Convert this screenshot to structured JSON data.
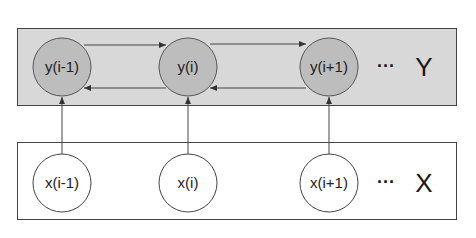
{
  "colors": {
    "background": "#ffffff",
    "y_layer_fill": "#d8d8d8",
    "y_node_fill": "#bdbdbd",
    "x_layer_fill": "#ffffff",
    "x_node_fill": "#ffffff",
    "stroke": "#444444"
  },
  "layers": {
    "y": {
      "label": "Y",
      "ellipsis": "···",
      "nodes": [
        {
          "label": "y(i-1)"
        },
        {
          "label": "y(i)"
        },
        {
          "label": "y(i+1)"
        }
      ]
    },
    "x": {
      "label": "X",
      "ellipsis": "···",
      "nodes": [
        {
          "label": "x(i-1)"
        },
        {
          "label": "x(i)"
        },
        {
          "label": "x(i+1)"
        }
      ]
    }
  },
  "edges": {
    "horizontal": [
      {
        "from": "y(i-1)",
        "to": "y(i)"
      },
      {
        "from": "y(i)",
        "to": "y(i-1)"
      },
      {
        "from": "y(i)",
        "to": "y(i+1)"
      },
      {
        "from": "y(i+1)",
        "to": "y(i)"
      }
    ],
    "vertical": [
      {
        "from": "x(i-1)",
        "to": "y(i-1)"
      },
      {
        "from": "x(i)",
        "to": "y(i)"
      },
      {
        "from": "x(i+1)",
        "to": "y(i+1)"
      }
    ]
  }
}
